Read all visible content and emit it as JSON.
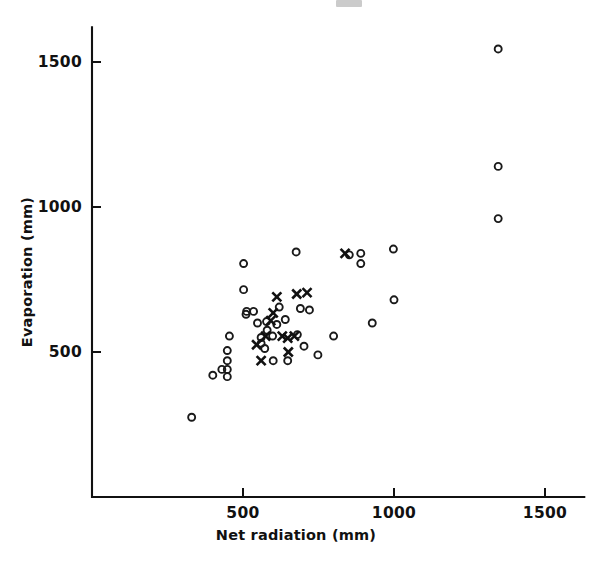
{
  "figure": {
    "background_color": "#ffffff",
    "ink_color": "#111111"
  },
  "chart_data": {
    "type": "scatter",
    "title": "",
    "xlabel": "Net radiation (mm)",
    "ylabel": "Evaporation (mm)",
    "xlim": [
      0,
      1630
    ],
    "ylim": [
      0,
      1620
    ],
    "xticks": [
      500,
      1000,
      1500
    ],
    "xtick_labels": [
      "500",
      "1000",
      "1500"
    ],
    "yticks": [
      500,
      1000,
      1500
    ],
    "ytick_labels": [
      "500",
      "1000",
      "1500"
    ],
    "grid": false,
    "legend": null,
    "axis_style": "left-and-bottom-spines-only",
    "series": [
      {
        "name": "circles",
        "marker": "open-circle",
        "marker_size_px": 7,
        "color": "#1a1a1a",
        "points": [
          [
            330,
            275
          ],
          [
            400,
            420
          ],
          [
            430,
            440
          ],
          [
            448,
            505
          ],
          [
            448,
            470
          ],
          [
            448,
            440
          ],
          [
            448,
            415
          ],
          [
            455,
            555
          ],
          [
            502,
            805
          ],
          [
            502,
            715
          ],
          [
            510,
            630
          ],
          [
            512,
            640
          ],
          [
            535,
            640
          ],
          [
            548,
            600
          ],
          [
            560,
            550
          ],
          [
            560,
            530
          ],
          [
            572,
            512
          ],
          [
            578,
            605
          ],
          [
            580,
            575
          ],
          [
            598,
            555
          ],
          [
            600,
            470
          ],
          [
            612,
            595
          ],
          [
            620,
            655
          ],
          [
            640,
            612
          ],
          [
            648,
            470
          ],
          [
            676,
            845
          ],
          [
            680,
            560
          ],
          [
            690,
            650
          ],
          [
            702,
            520
          ],
          [
            720,
            645
          ],
          [
            748,
            490
          ],
          [
            800,
            555
          ],
          [
            852,
            835
          ],
          [
            890,
            840
          ],
          [
            890,
            805
          ],
          [
            928,
            600
          ],
          [
            998,
            855
          ],
          [
            1000,
            680
          ],
          [
            1345,
            1545
          ],
          [
            1345,
            1140
          ],
          [
            1345,
            960
          ]
        ]
      },
      {
        "name": "crosses",
        "marker": "x-cross",
        "marker_size_px": 9,
        "color": "#111111",
        "points": [
          [
            545,
            525
          ],
          [
            560,
            470
          ],
          [
            575,
            555
          ],
          [
            592,
            608
          ],
          [
            600,
            635
          ],
          [
            612,
            690
          ],
          [
            630,
            555
          ],
          [
            648,
            548
          ],
          [
            650,
            500
          ],
          [
            670,
            555
          ],
          [
            678,
            700
          ],
          [
            712,
            705
          ],
          [
            838,
            840
          ]
        ]
      }
    ]
  },
  "axes_geometry": {
    "origin_px": [
      92,
      497
    ],
    "x_px_per_unit": 0.302,
    "y_px_per_unit": 0.29
  }
}
